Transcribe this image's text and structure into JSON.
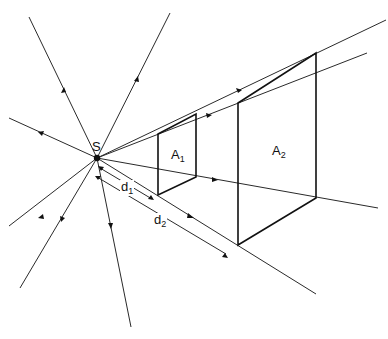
{
  "diagram": {
    "type": "inverse-square-law illustration",
    "source_point": {
      "label": "S",
      "x": 97,
      "y": 158
    },
    "areas": [
      {
        "label": "A",
        "sub": "1",
        "name": "area-1"
      },
      {
        "label": "A",
        "sub": "2",
        "name": "area-2"
      }
    ],
    "distances": [
      {
        "label": "d",
        "sub": "1",
        "name": "distance-1"
      },
      {
        "label": "d",
        "sub": "2",
        "name": "distance-2"
      }
    ],
    "colors": {
      "line": "#2a2a2a",
      "background": "#ffffff"
    }
  }
}
